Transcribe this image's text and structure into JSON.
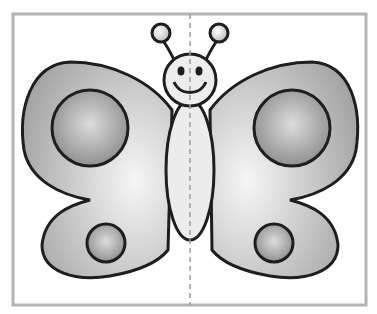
{
  "image": {
    "subject": "butterfly coloring/symmetry worksheet",
    "description": "Grey-shaded cartoon butterfly with smiling face, two antennae, oval body and four wings each with a round spot, inside a grey frame split by a dashed vertical symmetry line",
    "colors": {
      "frame": "#b4b4b4",
      "outline": "#1e1e1e",
      "wing_light": "#f2f2f2",
      "wing_dark": "#a8a8a8",
      "spot_light": "#d8d8d8",
      "spot_dark": "#8e8e8e",
      "body": "#ececec",
      "symmetry_line": "#9a9a9a"
    }
  }
}
